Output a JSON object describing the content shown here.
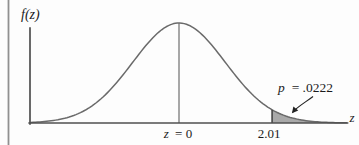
{
  "figure": {
    "ylabel": "f(z)",
    "xlabel": "z",
    "ticks": {
      "zero": {
        "variable": "z",
        "equals_value": "= 0",
        "full": "z = 0"
      },
      "critical": {
        "value": "2.01"
      }
    },
    "annotation": {
      "variable": "p",
      "equals_value": "= .0222",
      "full": "p = .0222"
    }
  },
  "colors": {
    "curve": "#6a6a6a",
    "axis": "#4f4f4f",
    "tail_shade": "#a9a9a9",
    "critical_line": "#3f3f3f",
    "mean_line": "#6e6e6e",
    "text": "#1b1b1b",
    "page_border": "#909090",
    "background": "#fdfdfd"
  },
  "chart_data": {
    "type": "area",
    "curve": "standard_normal_pdf",
    "title": "",
    "xlabel": "z",
    "ylabel": "f(z)",
    "x_range_z": [
      -3.2,
      3.62
    ],
    "mean_z": 0,
    "critical_z": 2.01,
    "tail": "upper",
    "p_value": 0.0222,
    "x_tick_labels": [
      "z = 0",
      "2.01"
    ],
    "annotation_text": "p = .0222",
    "grid": false,
    "legend": false
  }
}
